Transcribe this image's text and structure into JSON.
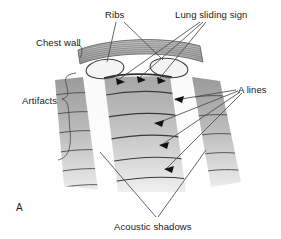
{
  "figure": {
    "panel_letter": "A",
    "type": "lung-ultrasound-schematic",
    "background_color": "#ffffff",
    "line_color": "#3a3a3a",
    "text_color": "#1a1a1a"
  },
  "labels": {
    "ribs": "Ribs",
    "lung_sliding_sign": "Lung sliding sign",
    "chest_wall": "Chest wall",
    "artifacts": "Artifacts",
    "a_lines": "A lines",
    "acoustic_shadows": "Acoustic shadows"
  },
  "label_positions": {
    "ribs": {
      "x": 105,
      "y": 10
    },
    "lung_sliding_sign": {
      "x": 175,
      "y": 10
    },
    "chest_wall": {
      "x": 36,
      "y": 38
    },
    "artifacts": {
      "x": 22,
      "y": 96
    },
    "a_lines": {
      "x": 238,
      "y": 85
    },
    "acoustic_shadows": {
      "x": 141,
      "y": 227
    },
    "panel_letter": {
      "x": 16,
      "y": 207
    }
  },
  "structures": {
    "chest_wall_band": {
      "name": "chest wall striated band",
      "fill": "#b4b4b4",
      "striation_color": "#6e6e6e",
      "striation_count": 13
    },
    "ribs": {
      "count": 2,
      "fill": "#f2f2f2",
      "stroke": "#3f3f3f",
      "left_center": {
        "x": 105,
        "y": 69
      },
      "right_center": {
        "x": 169,
        "y": 68
      },
      "rx": 19,
      "ry": 9.5
    },
    "pleural_line": {
      "name": "pleural line",
      "color": "#2e2e2e",
      "arrowhead_count": 3
    },
    "sector_columns": [
      {
        "name": "left-shadow-column",
        "fill": "#f0f0f0",
        "kind": "acoustic-shadow"
      },
      {
        "name": "left-artifact-column",
        "fill": "#b8b8b8",
        "kind": "artifact"
      },
      {
        "name": "center-column",
        "fill": "#aeaeae",
        "kind": "lung-field"
      },
      {
        "name": "right-shadow-column",
        "fill": "#f0f0f0",
        "kind": "acoustic-shadow"
      },
      {
        "name": "right-artifact-column",
        "fill": "#bcbcbc",
        "kind": "artifact"
      }
    ],
    "a_lines": {
      "count": 6,
      "color": "#3a3a3a",
      "description": "horizontal reverberation arcs parallel to pleural line"
    },
    "acoustic_shadow_markers": {
      "count": 2,
      "color": "#4a4a4a",
      "description": "V-shaped leader lines beneath rib shadows"
    }
  },
  "leader_lines": {
    "ribs_pointers": 2,
    "lung_sliding_pointers": 3,
    "chest_wall_pointers": 1,
    "artifacts_pointers": 1,
    "a_lines_pointers": 4,
    "acoustic_shadows_pointers": 2
  }
}
